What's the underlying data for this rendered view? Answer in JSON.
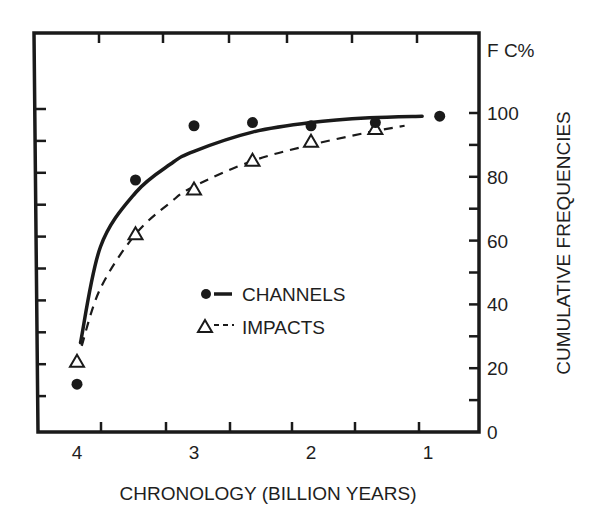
{
  "chart_data": {
    "type": "scatter",
    "title": "",
    "xlabel": "CHRONOLOGY (BILLION YEARS)",
    "ylabel": "CUMULATIVE FREQUENCIES",
    "y_unit_label": "F C%",
    "x_reversed": true,
    "xlim": [
      4.4,
      0.5
    ],
    "ylim": [
      0,
      100
    ],
    "x_ticks": [
      4,
      3,
      2,
      1
    ],
    "x_tick_labels": [
      "4",
      "3",
      "2",
      "1"
    ],
    "y_ticks": [
      0,
      20,
      40,
      60,
      80,
      100
    ],
    "y_tick_labels": [
      "0",
      "20",
      "40",
      "60",
      "80",
      "100"
    ],
    "y_axis_position": "right",
    "grid": false,
    "legend_position": "center",
    "series": [
      {
        "name": "CHANNELS",
        "marker": "filled-circle",
        "line": "solid fitted curve",
        "x": [
          4.0,
          3.5,
          3.0,
          2.5,
          2.0,
          1.45,
          0.9
        ],
        "y": [
          15,
          79,
          96,
          97,
          96,
          97,
          99
        ],
        "curve": {
          "x": [
            3.97,
            3.8,
            3.5,
            3.2,
            3.0,
            2.5,
            2.0,
            1.5,
            1.05
          ],
          "y": [
            28,
            58,
            75,
            84,
            88,
            94,
            97,
            98.5,
            99
          ]
        }
      },
      {
        "name": "IMPACTS",
        "marker": "open-triangle",
        "line": "dashed fitted curve",
        "x": [
          4.0,
          3.5,
          3.0,
          2.5,
          2.0,
          1.45
        ],
        "y": [
          22,
          62,
          76,
          85,
          91,
          95
        ],
        "curve": {
          "x": [
            3.96,
            3.8,
            3.5,
            3.2,
            3.0,
            2.5,
            2.0,
            1.5,
            1.2
          ],
          "y": [
            27,
            45,
            62,
            72,
            77,
            85,
            90,
            94,
            96
          ]
        }
      }
    ]
  }
}
